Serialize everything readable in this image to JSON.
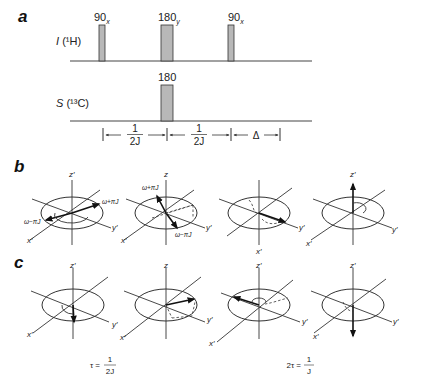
{
  "panels": {
    "a": {
      "label": "a",
      "channels": [
        {
          "name": "I",
          "nucleus": "(¹H)",
          "pulses": [
            {
              "angle": "90",
              "phase": "x"
            },
            {
              "angle": "180",
              "phase": "y"
            },
            {
              "angle": "90",
              "phase": "x"
            }
          ]
        },
        {
          "name": "S",
          "nucleus": "(¹³C)",
          "pulses": [
            {
              "angle": "180",
              "phase": ""
            }
          ]
        }
      ],
      "timing": [
        {
          "num": "1",
          "den": "2J"
        },
        {
          "num": "1",
          "den": "2J"
        },
        {
          "delta": "Δ"
        }
      ]
    },
    "b": {
      "label": "b",
      "frames": [
        {
          "z": "z′",
          "x": "x′",
          "y": "y′",
          "annotations": [
            "ω+πJ",
            "ω−πJ"
          ]
        },
        {
          "z": "z",
          "x": "x′",
          "y": "y′",
          "annotations": [
            "ω+πJ",
            "ω−πJ"
          ]
        },
        {
          "z": "",
          "x": "x′",
          "y": "y′",
          "annotations": []
        },
        {
          "z": "z′",
          "x": "x′",
          "y": "y′",
          "annotations": []
        }
      ]
    },
    "c": {
      "label": "c",
      "frames": [
        {
          "z": "z′",
          "x": "x′",
          "y": "y′"
        },
        {
          "z": "z",
          "x": "x′",
          "y": "y′"
        },
        {
          "z": "z′",
          "x": "x′",
          "y": "y′"
        },
        {
          "z": "z′",
          "x": "x′",
          "y": "y′"
        }
      ],
      "time_labels": [
        {
          "lhs": "τ =",
          "num": "1",
          "den": "2J"
        },
        {
          "lhs": "2τ =",
          "num": "1",
          "den": "J"
        }
      ]
    }
  },
  "colors": {
    "pulse_fill": "#b8b8b8",
    "line": "#333333",
    "background": "#ffffff"
  }
}
